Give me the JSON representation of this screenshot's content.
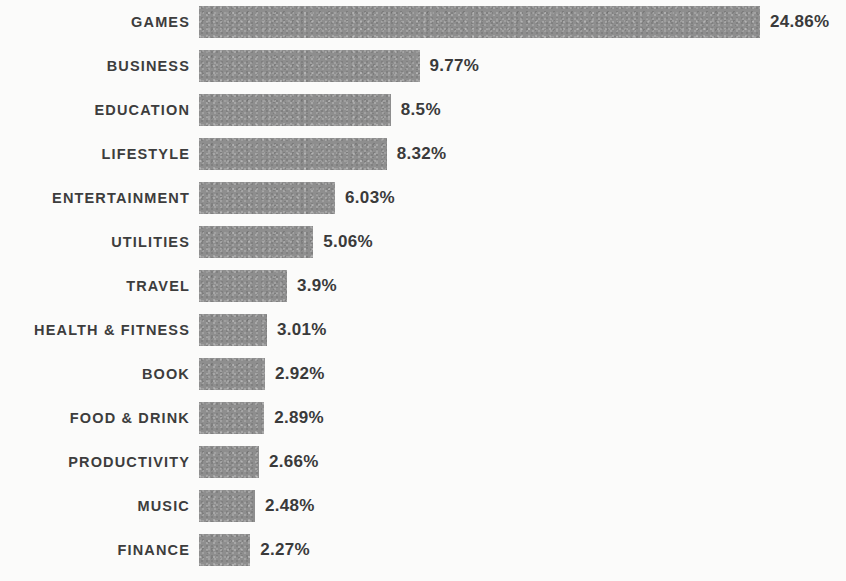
{
  "chart": {
    "title": "",
    "subtitle": "",
    "xlabel": "",
    "ylabel": ""
  },
  "chart_data": {
    "type": "bar",
    "orientation": "horizontal",
    "title": "",
    "subtitle": "",
    "xlabel": "",
    "ylabel": "",
    "grid": false,
    "legend": false,
    "legend_position": "none",
    "axis_visible": false,
    "value_suffix": "%",
    "xlim": [
      0,
      24.86
    ],
    "bar_color": "#8e8e8e",
    "label_color": "#3d3d3d",
    "value_color": "#3a3a3a",
    "background_color": "#fbfbfa",
    "categories": [
      "GAMES",
      "BUSINESS",
      "EDUCATION",
      "LIFESTYLE",
      "ENTERTAINMENT",
      "UTILITIES",
      "TRAVEL",
      "HEALTH & FITNESS",
      "BOOK",
      "FOOD & DRINK",
      "PRODUCTIVITY",
      "MUSIC",
      "FINANCE"
    ],
    "values": [
      24.86,
      9.77,
      8.5,
      8.32,
      6.03,
      5.06,
      3.9,
      3.01,
      2.92,
      2.89,
      2.66,
      2.48,
      2.27
    ],
    "value_labels": [
      "24.86%",
      "9.77%",
      "8.5%",
      "8.32%",
      "6.03%",
      "5.06%",
      "3.9%",
      "3.01%",
      "2.92%",
      "2.89%",
      "2.66%",
      "2.48%",
      "2.27%"
    ],
    "rows": [
      {
        "category": "GAMES",
        "value": 24.86,
        "value_label": "24.86%"
      },
      {
        "category": "BUSINESS",
        "value": 9.77,
        "value_label": "9.77%"
      },
      {
        "category": "EDUCATION",
        "value": 8.5,
        "value_label": "8.5%"
      },
      {
        "category": "LIFESTYLE",
        "value": 8.32,
        "value_label": "8.32%"
      },
      {
        "category": "ENTERTAINMENT",
        "value": 6.03,
        "value_label": "6.03%"
      },
      {
        "category": "UTILITIES",
        "value": 5.06,
        "value_label": "5.06%"
      },
      {
        "category": "TRAVEL",
        "value": 3.9,
        "value_label": "3.9%"
      },
      {
        "category": "HEALTH & FITNESS",
        "value": 3.01,
        "value_label": "3.01%"
      },
      {
        "category": "BOOK",
        "value": 2.92,
        "value_label": "2.92%"
      },
      {
        "category": "FOOD & DRINK",
        "value": 2.89,
        "value_label": "2.89%"
      },
      {
        "category": "PRODUCTIVITY",
        "value": 2.66,
        "value_label": "2.66%"
      },
      {
        "category": "MUSIC",
        "value": 2.48,
        "value_label": "2.48%"
      },
      {
        "category": "FINANCE",
        "value": 2.27,
        "value_label": "2.27%"
      }
    ]
  },
  "layout": {
    "px_per_unit": 22.57,
    "bar_origin_x": 199,
    "row_pitch": 44,
    "bar_height": 32,
    "top_offset": 6,
    "value_gap": 10
  }
}
